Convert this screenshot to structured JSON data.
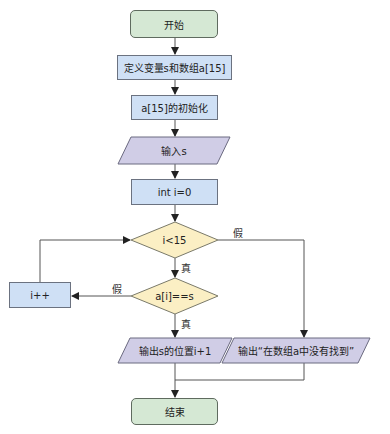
{
  "nodes": {
    "start": "开始",
    "define": "定义变量s和数组a[15]",
    "init": "a[15]的初始化",
    "input": "输入s",
    "assign": "int i=0",
    "cond_loop": "i<15",
    "cond_match": "a[i]==s",
    "increment": "i++",
    "output_found": "输出s的位置i+1",
    "output_notfound": "输出“在数组a中没有找到”",
    "end": "结束"
  },
  "edge_labels": {
    "loop_false": "假",
    "loop_true": "真",
    "match_false": "假",
    "match_true": "真"
  },
  "colors": {
    "terminal": "#d5e8d4",
    "process": "#cfe0f5",
    "io": "#d0cde6",
    "decision": "#fbefc4",
    "line": "#555555"
  }
}
